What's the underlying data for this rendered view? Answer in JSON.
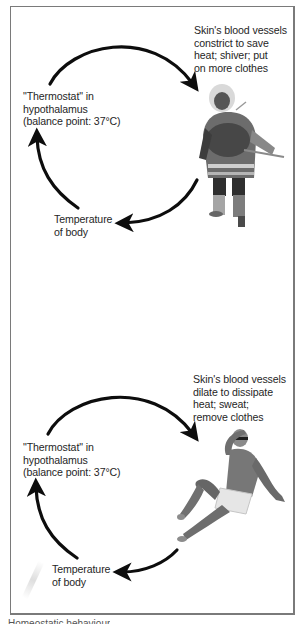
{
  "panels": [
    {
      "id": "cold",
      "effector_text": "Skin's blood vessels\nconstrict to save\nheat; shiver; put\non more clothes",
      "control_center_text": "\"Thermostat\" in\nhypothalamus\n(balance point: 37°C)",
      "variable_text": "Temperature\nof body",
      "figure": "person-in-winter-parka"
    },
    {
      "id": "hot",
      "effector_text": "Skin's blood vessels\ndilate to dissipate\nheat; sweat;\nremove clothes",
      "control_center_text": "\"Thermostat\" in\nhypothalamus\n(balance point: 37°C)",
      "variable_text": "Temperature\nof body",
      "figure": "man-in-swim-shorts"
    }
  ],
  "caption": "Homeostatic behaviour",
  "colors": {
    "arrow": "#0d0d0d",
    "text": "#262626",
    "frame": "#7a7a7a"
  }
}
